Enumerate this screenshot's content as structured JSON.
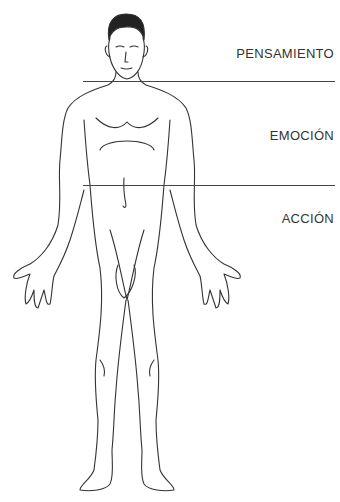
{
  "diagram": {
    "labels": {
      "thought": "PENSAMIENTO",
      "emotion": "EMOCIÓN",
      "action": "ACCIÓN"
    },
    "figure": "human-body-front-outline",
    "colors": {
      "line": "#444444",
      "text": "#333333",
      "background": "#ffffff"
    }
  }
}
